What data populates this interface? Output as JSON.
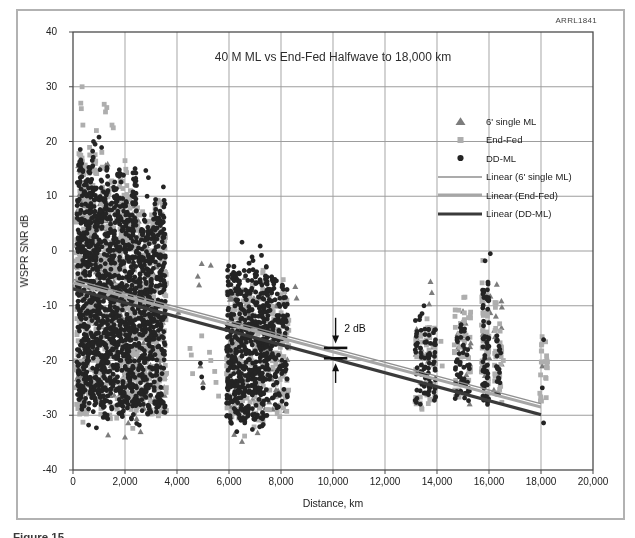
{
  "page": {
    "watermark": "ARRL1841",
    "caption_fragment": "Figure 15"
  },
  "chart_data": {
    "type": "scatter",
    "title": "40 M ML vs End-Fed Halfwave to 18,000 km",
    "xlabel": "Distance, km",
    "ylabel": "WSPR SNR dB",
    "xlim": [
      0,
      20000
    ],
    "ylim": [
      -40,
      40
    ],
    "grid": true,
    "legend_position": "upper right inside",
    "x_ticks": {
      "values": [
        0,
        2000,
        4000,
        6000,
        8000,
        10000,
        12000,
        14000,
        16000,
        18000,
        20000
      ],
      "labels": [
        "0",
        "2,000",
        "4,000",
        "6,000",
        "8,000",
        "10,000",
        "12,000",
        "14,000",
        "16,000",
        "18,000",
        "20,000"
      ]
    },
    "y_ticks": {
      "values": [
        40,
        30,
        20,
        10,
        0,
        -10,
        -20,
        -30,
        -40
      ],
      "labels": [
        "40",
        "30",
        "20",
        "10",
        "0",
        "-10",
        "-20",
        "-30",
        "-40"
      ]
    },
    "series": [
      {
        "name": "6' single ML",
        "marker": "triangle",
        "color": "#7c7c7c"
      },
      {
        "name": "End-Fed",
        "marker": "square",
        "color": "#aeaeae"
      },
      {
        "name": "DD-ML",
        "marker": "circle",
        "color": "#242424"
      }
    ],
    "lines": [
      {
        "name": "Linear (6' single ML)",
        "color": "#8f8f8f",
        "width": 1.4,
        "x": [
          0,
          18000
        ],
        "y": [
          -5.2,
          -27.9
        ]
      },
      {
        "name": "Linear (End-Fed)",
        "color": "#a6a6a6",
        "width": 3.0,
        "x": [
          0,
          18000
        ],
        "y": [
          -5.8,
          -28.5
        ]
      },
      {
        "name": "Linear (DD-ML)",
        "color": "#3a3a3a",
        "width": 3.2,
        "x": [
          0,
          18000
        ],
        "y": [
          -6.9,
          -29.9
        ]
      }
    ],
    "clusters": [
      [
        0,
        200,
        1300,
        10,
        110,
        -31,
        17
      ],
      [
        0,
        1450,
        2400,
        8,
        85,
        -32,
        14
      ],
      [
        0,
        2550,
        3500,
        8,
        70,
        -30,
        11
      ],
      [
        0,
        6000,
        7400,
        10,
        55,
        -32,
        -4
      ],
      [
        0,
        7500,
        8200,
        5,
        25,
        -30,
        -6
      ],
      [
        0,
        13200,
        13900,
        4,
        12,
        -27,
        -8
      ],
      [
        0,
        14750,
        15250,
        4,
        12,
        -28,
        -11
      ],
      [
        0,
        15800,
        16450,
        4,
        14,
        -27,
        -7
      ],
      [
        1,
        150,
        1350,
        11,
        350,
        -32,
        21
      ],
      [
        1,
        1450,
        2450,
        9,
        280,
        -32,
        16
      ],
      [
        1,
        2550,
        3550,
        9,
        230,
        -31,
        12
      ],
      [
        1,
        5950,
        7450,
        11,
        180,
        -33,
        -1
      ],
      [
        1,
        7550,
        8250,
        6,
        80,
        -31,
        -3
      ],
      [
        1,
        13200,
        13600,
        3,
        30,
        -29,
        -12
      ],
      [
        1,
        13700,
        13900,
        2,
        18,
        -29,
        -13
      ],
      [
        1,
        14700,
        15250,
        4,
        45,
        -29,
        -7
      ],
      [
        1,
        15750,
        15950,
        2,
        45,
        -28,
        -1.5
      ],
      [
        1,
        16250,
        16450,
        2,
        28,
        -28,
        -5.5
      ],
      [
        1,
        18000,
        18200,
        2,
        24,
        -29.5,
        -12
      ],
      [
        2,
        200,
        1300,
        11,
        650,
        -31.5,
        21
      ],
      [
        2,
        1450,
        2400,
        9,
        500,
        -32,
        16
      ],
      [
        2,
        2550,
        3500,
        9,
        420,
        -30.5,
        13
      ],
      [
        2,
        5950,
        7450,
        12,
        500,
        -32.5,
        0
      ],
      [
        2,
        7550,
        8200,
        6,
        130,
        -30,
        -2
      ],
      [
        2,
        13200,
        13550,
        3,
        45,
        -28.5,
        -11
      ],
      [
        2,
        13700,
        13900,
        2,
        40,
        -28,
        -11
      ],
      [
        2,
        14750,
        15200,
        4,
        50,
        -28.5,
        -12
      ],
      [
        2,
        15800,
        15950,
        2,
        60,
        -28.5,
        -2
      ],
      [
        2,
        16300,
        16400,
        2,
        20,
        -27,
        -15
      ]
    ],
    "outliers": [
      [
        0,
        [
          [
            4050,
            -11.2
          ],
          [
            4800,
            -4.6
          ],
          [
            4850,
            -6.2
          ],
          [
            4950,
            -2.3
          ],
          [
            5300,
            -2.6
          ],
          [
            8550,
            -6.5
          ],
          [
            8600,
            -8.6
          ],
          [
            1350,
            -33.6
          ],
          [
            2000,
            -34
          ],
          [
            2600,
            -33
          ],
          [
            6200,
            -33.5
          ],
          [
            6500,
            -34.8
          ],
          [
            7100,
            -33.2
          ],
          [
            13750,
            -5.6
          ],
          [
            13800,
            -7.6
          ],
          [
            16300,
            -6.1
          ],
          [
            18050,
            -21
          ],
          [
            5000,
            -24
          ],
          [
            4900,
            -21
          ],
          [
            15000,
            -11
          ],
          [
            15100,
            -13.2
          ]
        ]
      ],
      [
        1,
        [
          [
            350,
            30
          ],
          [
            300,
            27
          ],
          [
            320,
            26
          ],
          [
            380,
            23
          ],
          [
            1200,
            26.8
          ],
          [
            1300,
            26.2
          ],
          [
            1250,
            25.4
          ],
          [
            1500,
            23
          ],
          [
            1550,
            22.5
          ],
          [
            900,
            22
          ],
          [
            2000,
            16.5
          ],
          [
            4500,
            -17.8
          ],
          [
            4550,
            -19
          ],
          [
            4600,
            -22.4
          ],
          [
            5250,
            -18.5
          ],
          [
            5300,
            -20
          ],
          [
            5450,
            -22
          ],
          [
            5500,
            -24
          ],
          [
            5600,
            -26.5
          ],
          [
            4950,
            -15.5
          ],
          [
            14150,
            -16.5
          ],
          [
            14200,
            -21
          ],
          [
            2300,
            -32.4
          ],
          [
            6600,
            -33.8
          ],
          [
            16550,
            -20
          ]
        ]
      ],
      [
        2,
        [
          [
            6500,
            1.6
          ],
          [
            7200,
            0.9
          ],
          [
            7250,
            -0.8
          ],
          [
            600,
            -31.8
          ],
          [
            900,
            -32.3
          ],
          [
            2450,
            -31.5
          ],
          [
            2550,
            -31.8
          ],
          [
            6300,
            -33
          ],
          [
            6900,
            -32.6
          ],
          [
            18100,
            -16.2
          ],
          [
            18050,
            -25
          ],
          [
            18100,
            -31.4
          ],
          [
            4900,
            -20.5
          ],
          [
            4950,
            -23
          ],
          [
            5000,
            -25
          ],
          [
            16050,
            -0.5
          ],
          [
            13500,
            -10
          ],
          [
            15850,
            -1.8
          ],
          [
            2800,
            14.7
          ],
          [
            2850,
            10
          ],
          [
            2900,
            13.4
          ],
          [
            1000,
            20.8
          ],
          [
            850,
            19.5
          ],
          [
            1100,
            18.9
          ]
        ]
      ]
    ],
    "annotation": {
      "label": "2 dB",
      "arrow_x": 10100,
      "down_arrow": [
        -12.2,
        -16.9
      ],
      "up_arrow": [
        -24.1,
        -20.5
      ],
      "bar_x0": 9650,
      "bar_x1": 10550,
      "bar1_y": -17.7,
      "bar2_y": -19.6,
      "label_x": 10430,
      "label_y": -14.2
    }
  }
}
